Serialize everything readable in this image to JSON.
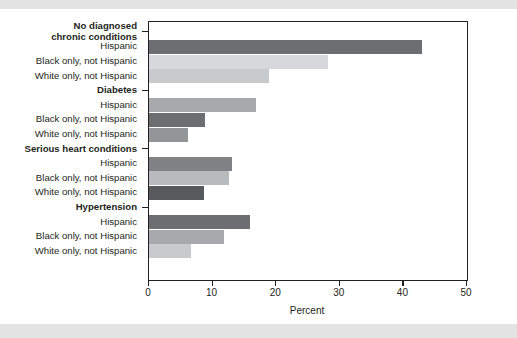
{
  "chart_data": {
    "type": "bar",
    "orientation": "horizontal",
    "title": "",
    "xlabel": "Percent",
    "ylabel": "",
    "xlim": [
      0,
      50
    ],
    "xticks": [
      0,
      10,
      20,
      30,
      40,
      50
    ],
    "grid": false,
    "legend": "none",
    "groups": [
      {
        "group_label_lines": [
          "No diagnosed",
          "chronic conditions"
        ],
        "bars": [
          {
            "label": "Hispanic",
            "value": 43.0,
            "color": "#6d6e70"
          },
          {
            "label": "Black only, not Hispanic",
            "value": 28.1,
            "color": "#d7d8d9"
          },
          {
            "label": "White only, not Hispanic",
            "value": 18.9,
            "color": "#c9cacb"
          }
        ]
      },
      {
        "group_label_lines": [
          "Diabetes"
        ],
        "bars": [
          {
            "label": "Hispanic",
            "value": 16.9,
            "color": "#a7a9ab"
          },
          {
            "label": "Black only, not Hispanic",
            "value": 8.8,
            "color": "#6d6e70"
          },
          {
            "label": "White only, not Hispanic",
            "value": 6.1,
            "color": "#939598"
          }
        ]
      },
      {
        "group_label_lines": [
          "Serious heart conditions"
        ],
        "bars": [
          {
            "label": "Hispanic",
            "value": 13.0,
            "color": "#808285"
          },
          {
            "label": "Black only, not Hispanic",
            "value": 12.5,
            "color": "#b9babc"
          },
          {
            "label": "White only, not Hispanic",
            "value": 8.7,
            "color": "#58595b"
          }
        ]
      },
      {
        "group_label_lines": [
          "Hypertension"
        ],
        "bars": [
          {
            "label": "Hispanic",
            "value": 15.9,
            "color": "#6d6e70"
          },
          {
            "label": "Black only, not Hispanic",
            "value": 11.8,
            "color": "#a7a9ab"
          },
          {
            "label": "White only, not Hispanic",
            "value": 6.6,
            "color": "#c9cacb"
          }
        ]
      }
    ]
  },
  "axis": {
    "x_title": "Percent",
    "x_tick_labels": [
      "0",
      "10",
      "20",
      "30",
      "40",
      "50"
    ]
  },
  "labels": {
    "group_1_line_1": "No diagnosed",
    "group_1_line_2": "chronic conditions",
    "group_2": "Diabetes",
    "group_3": "Serious heart conditions",
    "group_4": "Hypertension",
    "hispanic": "Hispanic",
    "black_only": "Black only, not Hispanic",
    "white_only": "White only, not Hispanic"
  },
  "colors": {
    "frame": "#231f20",
    "background": "#ffffff",
    "band": "#e3e3e3"
  }
}
